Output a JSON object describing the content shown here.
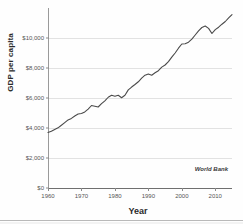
{
  "chart_data": {
    "type": "line",
    "title": "",
    "xlabel": "Year",
    "ylabel": "GDP per capita",
    "xlim": [
      1960,
      2015
    ],
    "ylim": [
      0,
      12000
    ],
    "grid": true,
    "legend_position": "none",
    "annotation": "World Bank",
    "ytick_labels": [
      "$12,000",
      "$10,000",
      "$8,000",
      "$6,000",
      "$4,000",
      "$2,000",
      "$0"
    ],
    "ytick_values": [
      12000,
      10000,
      8000,
      6000,
      4000,
      2000,
      0
    ],
    "ytick_visible": [
      false,
      true,
      true,
      true,
      true,
      true,
      true
    ],
    "xtick_labels": [
      "1960",
      "1970",
      "1980",
      "1990",
      "2000",
      "2010"
    ],
    "xtick_values": [
      1960,
      1970,
      1980,
      1990,
      2000,
      2010
    ],
    "series": [
      {
        "name": "GDP per capita",
        "color": "#4a4a4a",
        "x": [
          1960,
          1961,
          1962,
          1963,
          1964,
          1965,
          1966,
          1967,
          1968,
          1969,
          1970,
          1971,
          1972,
          1973,
          1974,
          1975,
          1976,
          1977,
          1978,
          1979,
          1980,
          1981,
          1982,
          1983,
          1984,
          1985,
          1986,
          1987,
          1988,
          1989,
          1990,
          1991,
          1992,
          1993,
          1994,
          1995,
          1996,
          1997,
          1998,
          1999,
          2000,
          2001,
          2002,
          2003,
          2004,
          2005,
          2006,
          2007,
          2008,
          2009,
          2010,
          2011,
          2012,
          2013,
          2014,
          2015
        ],
        "values": [
          3700,
          3780,
          3900,
          4010,
          4180,
          4360,
          4540,
          4640,
          4800,
          4930,
          4970,
          5070,
          5260,
          5500,
          5450,
          5400,
          5620,
          5810,
          6050,
          6180,
          6120,
          6180,
          6020,
          6180,
          6540,
          6730,
          6900,
          7080,
          7320,
          7520,
          7600,
          7520,
          7680,
          7820,
          8060,
          8200,
          8430,
          8720,
          9000,
          9320,
          9600,
          9620,
          9720,
          9920,
          10200,
          10480,
          10700,
          10800,
          10640,
          10300,
          10560,
          10720,
          10920,
          11100,
          11340,
          11560
        ]
      }
    ]
  }
}
